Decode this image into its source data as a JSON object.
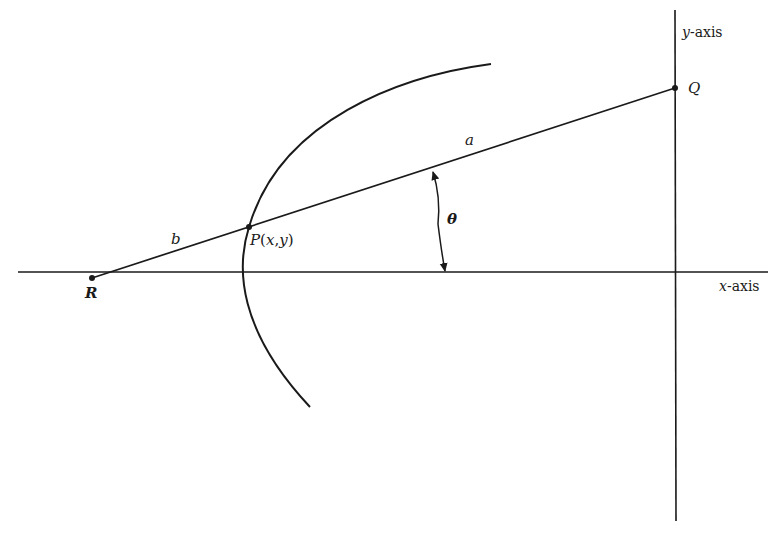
{
  "diagram": {
    "type": "geometry",
    "stroke_color": "#1a1a1a",
    "background": "#ffffff",
    "axes": {
      "x_label": "x-axis",
      "x_label_var": "x",
      "x_label_suffix": "-axis",
      "y_label": "y-axis",
      "y_label_var": "y",
      "y_label_suffix": "-axis"
    },
    "points": {
      "R": {
        "label": "R"
      },
      "Q": {
        "label": "Q"
      },
      "P": {
        "label": "P(x,y)",
        "name": "P",
        "open": "(",
        "x": "x",
        "comma": ",",
        "y": "y",
        "close": ")"
      }
    },
    "segments": {
      "a": {
        "label": "a"
      },
      "b": {
        "label": "b"
      }
    },
    "angle": {
      "label": "θ"
    },
    "curve": {
      "description": "hyperbola-like branch passing through P"
    }
  }
}
